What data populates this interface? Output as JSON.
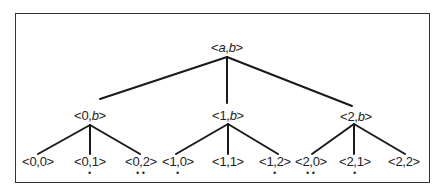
{
  "diagram": {
    "type": "tree",
    "root": {
      "id": "ab",
      "label_prefix": "<",
      "label_a": "a",
      "label_sep": ",",
      "label_b": "b",
      "label_suffix": ">",
      "x": 227,
      "y": 47
    },
    "level1": [
      {
        "id": "0b",
        "first": "0",
        "second": "b",
        "x": 90,
        "y": 115
      },
      {
        "id": "1b",
        "first": "1",
        "second": "b",
        "x": 228,
        "y": 115
      },
      {
        "id": "2b",
        "first": "2",
        "second": "b",
        "x": 356,
        "y": 116
      }
    ],
    "leaves": [
      {
        "label": "<0,0>",
        "x": 38,
        "y": 161,
        "marks": ""
      },
      {
        "label": "<0,1>",
        "x": 90,
        "y": 161,
        "marks": "•"
      },
      {
        "label": "<0,2>",
        "x": 141,
        "y": 161,
        "marks": "••"
      },
      {
        "label": "<1,0>",
        "x": 178,
        "y": 161,
        "marks": "•"
      },
      {
        "label": "<1,1>",
        "x": 228,
        "y": 161,
        "marks": ""
      },
      {
        "label": "<1,2>",
        "x": 275,
        "y": 161,
        "marks": "•"
      },
      {
        "label": "<2,0>",
        "x": 311,
        "y": 161,
        "marks": "••"
      },
      {
        "label": "<2,1>",
        "x": 355,
        "y": 161,
        "marks": "•"
      },
      {
        "label": "<2,2>",
        "x": 404,
        "y": 161,
        "marks": ""
      }
    ],
    "edges_root": [
      {
        "x1": 227,
        "y1": 57,
        "x2": 100,
        "y2": 99
      },
      {
        "x1": 227,
        "y1": 57,
        "x2": 227,
        "y2": 103
      },
      {
        "x1": 227,
        "y1": 57,
        "x2": 352,
        "y2": 106
      }
    ],
    "edges_leaf": [
      {
        "x1": 90,
        "y1": 125,
        "x2": 38,
        "y2": 154
      },
      {
        "x1": 90,
        "y1": 125,
        "x2": 90,
        "y2": 154
      },
      {
        "x1": 90,
        "y1": 125,
        "x2": 140,
        "y2": 154
      },
      {
        "x1": 228,
        "y1": 124,
        "x2": 176,
        "y2": 154
      },
      {
        "x1": 228,
        "y1": 124,
        "x2": 228,
        "y2": 154
      },
      {
        "x1": 228,
        "y1": 124,
        "x2": 278,
        "y2": 154
      },
      {
        "x1": 354,
        "y1": 124,
        "x2": 312,
        "y2": 154
      },
      {
        "x1": 354,
        "y1": 124,
        "x2": 354,
        "y2": 154
      },
      {
        "x1": 354,
        "y1": 124,
        "x2": 405,
        "y2": 154
      }
    ],
    "line_color": "#1a1a1a"
  }
}
